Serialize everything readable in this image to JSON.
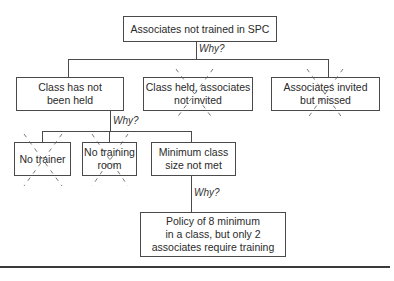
{
  "diagram": {
    "type": "why-why tree",
    "root": {
      "label": "Associates not trained in SPC"
    },
    "why_labels": [
      "Why?",
      "Why?",
      "Why?"
    ],
    "level2": [
      {
        "label": "Class has not\nbeen held",
        "crossed_out": false
      },
      {
        "label": "Class held, associates\nnot invited",
        "crossed_out": true
      },
      {
        "label": "Associates invited\nbut missed",
        "crossed_out": true
      }
    ],
    "level3": [
      {
        "label": "No trainer",
        "crossed_out": true
      },
      {
        "label": "No training\nroom",
        "crossed_out": true
      },
      {
        "label": "Minimum class\nsize not met",
        "crossed_out": false
      }
    ],
    "root_cause": {
      "label": "Policy of 8 minimum\nin a class, but only 2\nassociates require training"
    }
  },
  "colors": {
    "line": "#4a4a4a",
    "text": "#2a2a2a",
    "background": "#ffffff"
  }
}
